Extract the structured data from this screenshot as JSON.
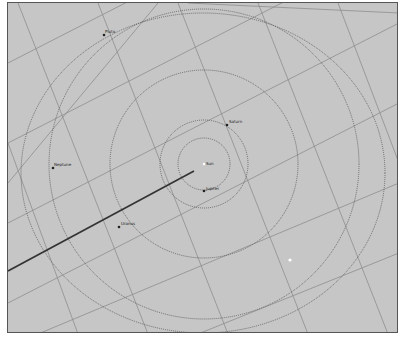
{
  "view": {
    "background": "#c6c6c6",
    "grid_color": "#8e8e8e",
    "orbit_color": "#555555",
    "center": {
      "x": 196,
      "y": 161
    }
  },
  "bodies": [
    {
      "name": "Sun",
      "x": 196,
      "y": 161,
      "label_dx": 2,
      "label_dy": 1
    },
    {
      "name": "Jupiter",
      "x": 196,
      "y": 188,
      "label_dx": 2,
      "label_dy": -1
    },
    {
      "name": "Saturn",
      "x": 219,
      "y": 122,
      "label_dx": 2,
      "label_dy": -2
    },
    {
      "name": "Uranus",
      "x": 111,
      "y": 224,
      "label_dx": 2,
      "label_dy": -2
    },
    {
      "name": "Neptune",
      "x": 45,
      "y": 165,
      "label_dx": 1,
      "label_dy": -2
    },
    {
      "name": "Pluto",
      "x": 96,
      "y": 32,
      "label_dx": 1,
      "label_dy": -2
    }
  ],
  "orbits": [
    {
      "name": "Jupiter orbit",
      "r": 26
    },
    {
      "name": "Saturn orbit",
      "r": 44
    },
    {
      "name": "Uranus orbit",
      "r": 94
    },
    {
      "name": "Neptune orbit",
      "r": 155
    },
    {
      "name": "Pluto orbit",
      "rx": 182,
      "ry": 160,
      "cx": 195,
      "cy": 170
    }
  ],
  "pointer_line": {
    "x1": 0,
    "y1": 268,
    "x2": 186,
    "y2": 168
  },
  "marker": {
    "x": 282,
    "y": 257
  }
}
